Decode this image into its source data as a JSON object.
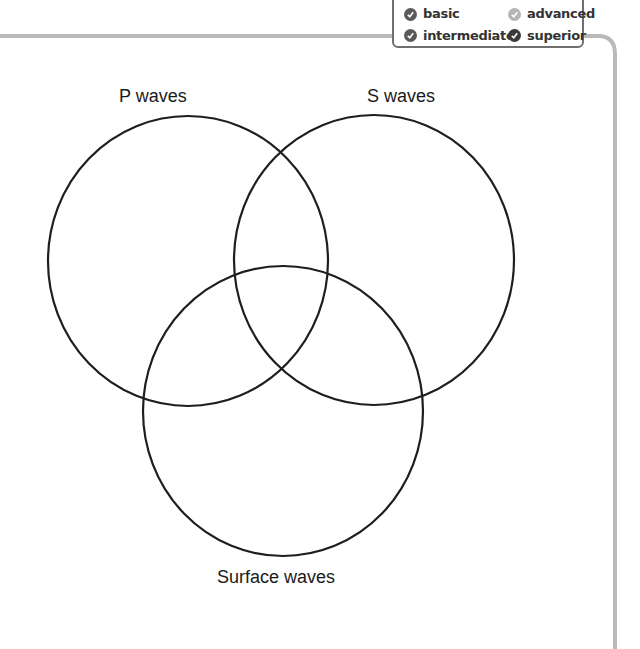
{
  "legend": {
    "items": [
      {
        "label": "basic",
        "icon": "check-circle-icon",
        "color": "#5a5a5a"
      },
      {
        "label": "advanced",
        "icon": "check-circle-icon",
        "color": "#b5b5b5"
      },
      {
        "label": "intermediate",
        "icon": "check-circle-icon",
        "color": "#5a5a5a"
      },
      {
        "label": "superior",
        "icon": "check-circle-icon",
        "color": "#3a3a3a"
      }
    ]
  },
  "diagram": {
    "type": "venn",
    "sets": [
      {
        "label": "P waves",
        "cx": 188,
        "cy": 261
      },
      {
        "label": "S waves",
        "cx": 374,
        "cy": 260
      },
      {
        "label": "Surface waves",
        "cx": 283,
        "cy": 411
      }
    ],
    "stroke_color": "#1e1e1e",
    "frame_color": "#b9b9b9"
  }
}
